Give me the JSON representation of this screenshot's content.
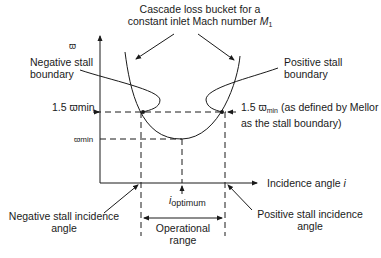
{
  "diagram": {
    "title_line1": "Cascade loss bucket for a",
    "title_line2": "constant inlet Mach number ",
    "title_symbol": "M",
    "title_subscript": "1",
    "y_axis_label": "ϖ",
    "x_axis_label": "Incidence angle ",
    "x_axis_symbol": "i",
    "neg_stall_boundary_line1": "Negative stall",
    "neg_stall_boundary_line2": "boundary",
    "pos_stall_boundary_line1": "Positive stall",
    "pos_stall_boundary_line2": "boundary",
    "level_high_label": "1.5 ϖmin",
    "level_high_right_prefix": "1.5 ϖ",
    "level_high_right_sub": "min",
    "level_high_right_suffix": " (as defined by Mellor",
    "level_high_right_line2": "as the stall boundary)",
    "level_min_label": "ϖmin",
    "optimum_i": "i",
    "optimum_sub": "optimum",
    "neg_incidence_line1": "Negative stall incidence",
    "neg_incidence_line2": "angle",
    "pos_incidence_line1": "Positive stall incidence",
    "pos_incidence_line2": "angle",
    "range_line1": "Operational",
    "range_line2": "range",
    "colors": {
      "line": "#1a1a1a",
      "background": "#ffffff"
    }
  }
}
